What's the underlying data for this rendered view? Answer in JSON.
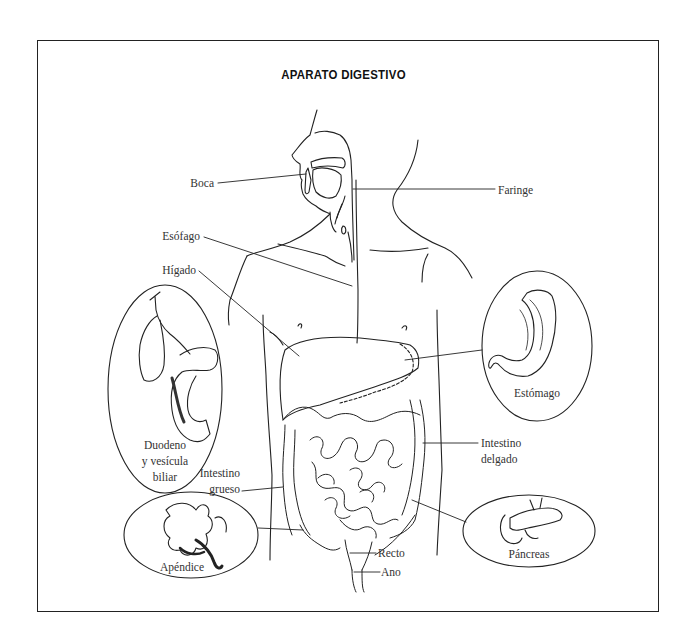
{
  "diagram": {
    "title": "APARATO DIGESTIVO",
    "labels": {
      "boca": "Boca",
      "faringe": "Faringe",
      "esofago": "Esófago",
      "higado": "Hígado",
      "estomago": "Estómago",
      "duodeno_line1": "Duodeno",
      "duodeno_line2": "y vesícula",
      "duodeno_line3": "biliar",
      "intestino_delgado_line1": "Intestino",
      "intestino_delgado_line2": "delgado",
      "intestino_grueso_line1": "Intestino",
      "intestino_grueso_line2": "grueso",
      "apendice": "Apéndice",
      "pancreas": "Páncreas",
      "recto": "Recto",
      "ano": "Ano"
    },
    "inset_ovals": [
      "Duodeno y vesícula biliar",
      "Apéndice",
      "Estómago",
      "Páncreas"
    ],
    "colors": {
      "line": "#222222",
      "text": "#333333",
      "background": "#ffffff"
    }
  }
}
